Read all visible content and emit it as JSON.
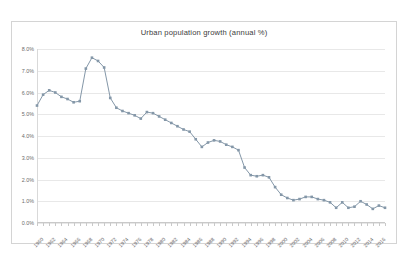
{
  "chart_data": {
    "type": "line",
    "title": "Urban population growth (annual %)",
    "xlabel": "",
    "ylabel": "",
    "ylim": [
      0,
      8
    ],
    "ytick_values": [
      0,
      1,
      2,
      3,
      4,
      5,
      6,
      7,
      8
    ],
    "ytick_labels": [
      "0.0%",
      "1.0%",
      "2.0%",
      "3.0%",
      "4.0%",
      "5.0%",
      "6.0%",
      "7.0%",
      "8.0%"
    ],
    "xtick_labels": [
      "1960",
      "1962",
      "1964",
      "1966",
      "1968",
      "1970",
      "1972",
      "1974",
      "1976",
      "1978",
      "1980",
      "1982",
      "1984",
      "1986",
      "1988",
      "1990",
      "1992",
      "1994",
      "1996",
      "1998",
      "2000",
      "2002",
      "2004",
      "2006",
      "2008",
      "2010",
      "2012",
      "2014",
      "2016"
    ],
    "xtick_step": 2,
    "grid": true,
    "legend": false,
    "marker": "square",
    "series_color": "#8497a8",
    "x": [
      1960,
      1961,
      1962,
      1963,
      1964,
      1965,
      1966,
      1967,
      1968,
      1969,
      1970,
      1971,
      1972,
      1973,
      1974,
      1975,
      1976,
      1977,
      1978,
      1979,
      1980,
      1981,
      1982,
      1983,
      1984,
      1985,
      1986,
      1987,
      1988,
      1989,
      1990,
      1991,
      1992,
      1993,
      1994,
      1995,
      1996,
      1997,
      1998,
      1999,
      2000,
      2001,
      2002,
      2003,
      2004,
      2005,
      2006,
      2007,
      2008,
      2009,
      2010,
      2011,
      2012,
      2013,
      2014,
      2015,
      2016,
      2017
    ],
    "values": [
      5.4,
      5.9,
      6.1,
      6.0,
      5.8,
      5.7,
      5.55,
      5.6,
      7.1,
      7.6,
      7.45,
      7.15,
      5.75,
      5.3,
      5.15,
      5.05,
      4.95,
      4.8,
      5.1,
      5.05,
      4.9,
      4.75,
      4.6,
      4.45,
      4.3,
      4.2,
      3.85,
      3.5,
      3.7,
      3.8,
      3.75,
      3.6,
      3.5,
      3.35,
      2.55,
      2.2,
      2.15,
      2.2,
      2.1,
      1.65,
      1.3,
      1.15,
      1.05,
      1.1,
      1.2,
      1.2,
      1.1,
      1.05,
      0.95,
      0.7,
      0.95,
      0.7,
      0.75,
      1.0,
      0.85,
      0.65,
      0.8,
      0.7
    ]
  }
}
